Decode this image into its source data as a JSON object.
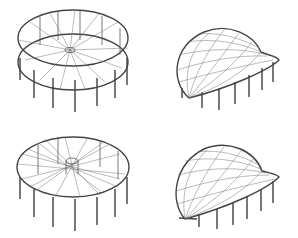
{
  "figure": {
    "panels": [
      {
        "id": "tl",
        "label": "",
        "description": "circular ring truss with radial spokes and columns, upper view"
      },
      {
        "id": "tr",
        "label": "",
        "description": "saddle-shaped cable-net membrane roof on columns"
      },
      {
        "id": "bl",
        "label": "",
        "description": "circular ring truss with crossing radial cable pattern and columns"
      },
      {
        "id": "br",
        "label": "",
        "description": "saddle-shaped cable-net membrane roof on columns, variant"
      }
    ],
    "colors": {
      "line": "#555555",
      "background": "#ffffff"
    }
  }
}
